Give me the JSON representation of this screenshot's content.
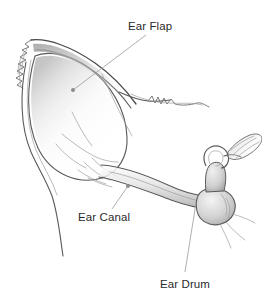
{
  "figure": {
    "background_color": "#ffffff",
    "ink_color": "#5a5a5a",
    "text_color": "#2b2b2b",
    "leader_color": "#9a9a9a",
    "width": 262,
    "height": 299
  },
  "labels": [
    {
      "id": "ear-flap",
      "text": "Ear Flap",
      "text_x": 128,
      "text_y": 30,
      "leader_from_x": 146,
      "leader_from_y": 35,
      "leader_to_x": 73,
      "leader_to_y": 90
    },
    {
      "id": "ear-canal",
      "text": "Ear Canal",
      "text_x": 78,
      "text_y": 221,
      "leader_from_x": 112,
      "leader_from_y": 209,
      "leader_to_x": 128,
      "leader_to_y": 186
    },
    {
      "id": "ear-drum",
      "text": "Ear Drum",
      "text_x": 160,
      "text_y": 288,
      "leader_from_x": 185,
      "leader_from_y": 272,
      "leader_to_x": 196,
      "leader_to_y": 203
    }
  ],
  "anatomy": {
    "pinna_name": "ear-flap-pinna",
    "canal_name": "ear-canal-tube",
    "drum_name": "ear-drum-structure"
  }
}
